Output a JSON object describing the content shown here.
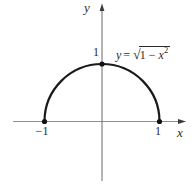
{
  "labels": {
    "y_axis": "y",
    "x_axis": "x",
    "y_tick_1": "1",
    "x_tick_neg1": "−1",
    "x_tick_1": "1"
  },
  "equation": {
    "variable": "y",
    "equals": "=",
    "radical_sign": "√",
    "radicand_prefix": "1 − ",
    "radicand_variable": "x",
    "exponent": "2",
    "full_text": "y = √(1 − x²)"
  },
  "chart_data": {
    "type": "line",
    "title": "",
    "equation": "y = √(1 − x²)",
    "xlabel": "x",
    "ylabel": "y",
    "x_range": [
      -1,
      1
    ],
    "y_range": [
      0,
      1
    ],
    "shape": "upper unit semicircle",
    "center": [
      0,
      0
    ],
    "radius": 1,
    "key_points": [
      [
        -1,
        0
      ],
      [
        0,
        1
      ],
      [
        1,
        0
      ]
    ],
    "x_ticks": [
      -1,
      1
    ],
    "y_ticks": [
      1
    ],
    "grid": false,
    "legend": false
  },
  "colors": {
    "curve": "#1a1a1a",
    "x_axis": "#8f8f8f",
    "y_axis": "#6a6a6a",
    "arrow": "#3a3a3a",
    "point": "#111111",
    "text": "#2b2b2b",
    "background": "#ffffff"
  }
}
